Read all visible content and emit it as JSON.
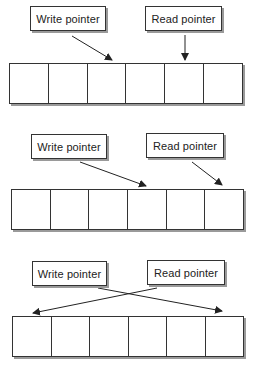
{
  "diagrams": [
    {
      "write_label": "Write pointer",
      "read_label": "Read pointer",
      "cells": 6,
      "write_points_to_cell": 3,
      "read_points_to_cell": 5
    },
    {
      "write_label": "Write pointer",
      "read_label": "Read pointer",
      "cells": 6,
      "write_points_to_cell": 4,
      "read_points_to_cell": 6
    },
    {
      "write_label": "Write pointer",
      "read_label": "Read pointer",
      "cells": 6,
      "write_points_to_cell": 6,
      "read_points_to_cell": 1
    }
  ]
}
